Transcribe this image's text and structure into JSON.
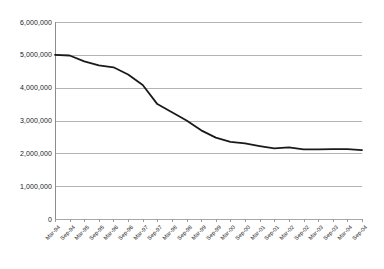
{
  "chart_data": {
    "type": "line",
    "title": "",
    "subtitle": "",
    "xlabel": "",
    "ylabel": "",
    "grid": true,
    "legend": false,
    "legend_position": "none",
    "xlim_categories": [
      "Mar-94",
      "Sep-04"
    ],
    "ylim": [
      0,
      6000000
    ],
    "y_ticks": [
      0,
      1000000,
      2000000,
      3000000,
      4000000,
      5000000,
      6000000
    ],
    "y_tick_labels": [
      "0",
      "1,000,000",
      "2,000,000",
      "3,000,000",
      "4,000,000",
      "5,000,000",
      "6,000,000"
    ],
    "categories": [
      "Mar-94",
      "Sep-94",
      "Mar-95",
      "Sep-95",
      "Mar-96",
      "Sep-96",
      "Mar-97",
      "Sep-97",
      "Mar-98",
      "Sep-98",
      "Mar-99",
      "Sep-99",
      "Mar-00",
      "Sep-00",
      "Mar-01",
      "Sep-01",
      "Mar-02",
      "Sep-02",
      "Mar-03",
      "Sep-03",
      "Mar-04",
      "Sep-04"
    ],
    "series": [
      {
        "name": "series-1",
        "color": "#1a1a1a",
        "line_width": 1.8,
        "markers": false,
        "values": [
          5000000,
          4980000,
          4800000,
          4680000,
          4620000,
          4400000,
          4080000,
          3500000,
          3250000,
          3000000,
          2700000,
          2480000,
          2350000,
          2300000,
          2220000,
          2150000,
          2180000,
          2120000,
          2120000,
          2130000,
          2130000,
          2100000
        ]
      }
    ],
    "colors": {
      "line": "#1a1a1a",
      "gridline": "#b4b4b4",
      "axis": "#8c8c8c",
      "background": "#ffffff",
      "text": "#1a1a1a"
    }
  }
}
